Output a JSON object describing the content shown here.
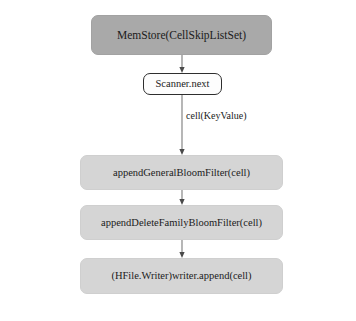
{
  "diagram": {
    "title_present": false,
    "background_color": "#ffffff",
    "colors": {
      "top_node_fill": "#a9a9a9",
      "step_node_fill": "#d5d5d5",
      "scanner_node_fill": "#fdfdfd",
      "scanner_node_border": "#2e2e2e",
      "edge_color": "#6e6e6e",
      "text_color": "#1b1b1b"
    },
    "nodes": [
      {
        "id": "memstore",
        "label": "MemStore(CellSkipListSet)",
        "shape": "rounded-rect",
        "fill": "#a9a9a9",
        "x": 91,
        "y": 15,
        "width": 181,
        "height": 40
      },
      {
        "id": "scanner",
        "label": "Scanner.next",
        "shape": "rounded-rect-outlined",
        "fill": "#fdfdfd",
        "x": 143,
        "y": 73,
        "width": 79,
        "height": 22
      },
      {
        "id": "general_bloom",
        "label": "appendGeneralBloomFilter(cell)",
        "shape": "rounded-rect",
        "fill": "#d5d5d5",
        "x": 80,
        "y": 155,
        "width": 203,
        "height": 35
      },
      {
        "id": "delete_family_bloom",
        "label": "appendDeleteFamilyBloomFilter(cell)",
        "shape": "rounded-rect",
        "fill": "#d5d5d5",
        "x": 80,
        "y": 205,
        "width": 203,
        "height": 35
      },
      {
        "id": "hfile_writer",
        "label": "(HFile.Writer)writer.append(cell)",
        "shape": "rounded-rect",
        "fill": "#d5d5d5",
        "x": 80,
        "y": 258,
        "width": 203,
        "height": 36
      }
    ],
    "edges": [
      {
        "id": "edge-memstore-scanner",
        "from": "memstore",
        "to": "scanner",
        "label": "",
        "arrowhead": true
      },
      {
        "id": "edge-scanner-general-bloom",
        "from": "scanner",
        "to": "general_bloom",
        "label": "cell(KeyValue)",
        "label_x": 186,
        "label_y": 117,
        "arrowhead": true
      },
      {
        "id": "edge-general-delete",
        "from": "general_bloom",
        "to": "delete_family_bloom",
        "label": "",
        "arrowhead": true
      },
      {
        "id": "edge-delete-hfile",
        "from": "delete_family_bloom",
        "to": "hfile_writer",
        "label": "",
        "arrowhead": true
      }
    ]
  }
}
